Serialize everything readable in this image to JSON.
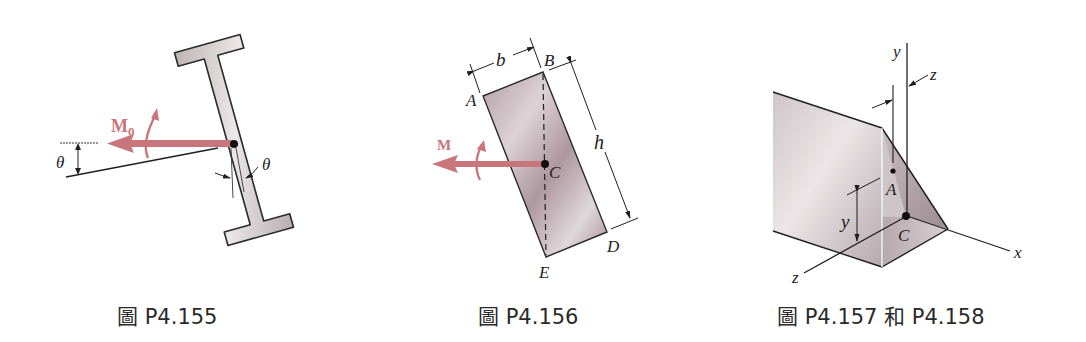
{
  "figures": [
    {
      "id": "p4-155",
      "caption": "圖 P4.155",
      "labels": {
        "moment": "M",
        "moment_sub": "0",
        "angle_left": "θ",
        "angle_right": "θ"
      },
      "description": "Tilted I-beam with couple moment M0 acting at centroid, inclined by angle θ"
    },
    {
      "id": "p4-156",
      "caption": "圖 P4.156",
      "labels": {
        "moment": "M",
        "width": "b",
        "height": "h",
        "A": "A",
        "B": "B",
        "C": "C",
        "D": "D",
        "E": "E"
      },
      "description": "Tilted rectangular section b × h with couple M acting at centroid C, dashed line BE"
    },
    {
      "id": "p4-157-158",
      "caption": "圖 P4.157 和 P4.158",
      "labels": {
        "y_axis": "y",
        "z_axis": "z",
        "x_axis": "x",
        "z_offset": "z",
        "y_dim": "y",
        "A": "A",
        "C": "C"
      },
      "description": "Isometric angle section with centroid C, point A, dimensions y and z"
    }
  ],
  "colors": {
    "moment_arrow": "#c8757b",
    "section_fill": "#c9bfc2",
    "section_dark": "#a8979c",
    "line": "#1f1f1f",
    "caption_text": "#2a2a2a"
  }
}
